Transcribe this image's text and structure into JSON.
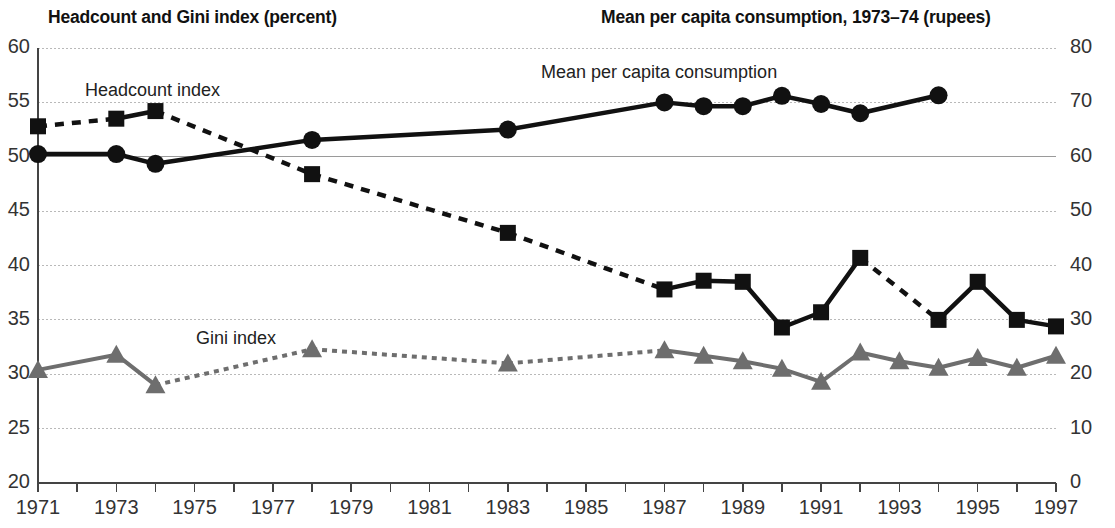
{
  "titles": {
    "left": "Headcount and Gini index (percent)",
    "right": "Mean per capita consumption, 1973–74 (rupees)"
  },
  "series_labels": {
    "headcount": "Headcount index",
    "gini": "Gini index",
    "consumption": "Mean per capita consumption"
  },
  "colors": {
    "headcount": "#111111",
    "consumption": "#111111",
    "gini": "#6e6e6e",
    "grid": "#b9b9b9",
    "axis": "#555555",
    "text": "#1a1a1a"
  },
  "chart_data": {
    "type": "line",
    "xlabel": "",
    "ylabel": "Headcount and Gini index (percent)",
    "y2label": "Mean per capita consumption, 1973–74 (rupees)",
    "xlim": [
      1971,
      1997
    ],
    "ylim": [
      20,
      60
    ],
    "y2lim": [
      0,
      80
    ],
    "yticks": [
      20,
      25,
      30,
      35,
      40,
      45,
      50,
      55,
      60
    ],
    "y2ticks": [
      0,
      10,
      20,
      30,
      40,
      50,
      60,
      70,
      80
    ],
    "xticks": [
      1971,
      1972,
      1973,
      1974,
      1975,
      1976,
      1977,
      1978,
      1979,
      1980,
      1981,
      1982,
      1983,
      1984,
      1985,
      1986,
      1987,
      1988,
      1989,
      1990,
      1991,
      1992,
      1993,
      1994,
      1995,
      1996,
      1997
    ],
    "xtick_labels": [
      "1971",
      "",
      "1973",
      "",
      "1975",
      "",
      "1977",
      "",
      "1979",
      "",
      "1981",
      "",
      "1983",
      "",
      "1985",
      "",
      "1987",
      "",
      "1989",
      "",
      "1991",
      "",
      "1993",
      "",
      "1995",
      "",
      "1997"
    ],
    "grid": true,
    "legend": "inline-annotations",
    "series": [
      {
        "name": "Headcount index",
        "axis": "left",
        "marker": "square",
        "linestyle": "mixed",
        "points": [
          {
            "x": 1971,
            "y": 52.8,
            "gap_after": true
          },
          {
            "x": 1973,
            "y": 53.5,
            "gap_after": false
          },
          {
            "x": 1974,
            "y": 54.2,
            "gap_after": true
          },
          {
            "x": 1978,
            "y": 48.4,
            "gap_after": true
          },
          {
            "x": 1983,
            "y": 43.0,
            "gap_after": true
          },
          {
            "x": 1987,
            "y": 37.8,
            "gap_after": false
          },
          {
            "x": 1988,
            "y": 38.6,
            "gap_after": false
          },
          {
            "x": 1989,
            "y": 38.5,
            "gap_after": false
          },
          {
            "x": 1990,
            "y": 34.3,
            "gap_after": false
          },
          {
            "x": 1991,
            "y": 35.7,
            "gap_after": false
          },
          {
            "x": 1992,
            "y": 40.7,
            "gap_after": true
          },
          {
            "x": 1994,
            "y": 35.0,
            "gap_after": false
          },
          {
            "x": 1995,
            "y": 38.5,
            "gap_after": false
          },
          {
            "x": 1996,
            "y": 35.0,
            "gap_after": false
          },
          {
            "x": 1997,
            "y": 34.4,
            "gap_after": false
          }
        ]
      },
      {
        "name": "Gini index",
        "axis": "left",
        "marker": "triangle",
        "linestyle": "mixed",
        "points": [
          {
            "x": 1971,
            "y": 30.4,
            "gap_after": false
          },
          {
            "x": 1973,
            "y": 31.8,
            "gap_after": false
          },
          {
            "x": 1974,
            "y": 29.0,
            "gap_after": true
          },
          {
            "x": 1978,
            "y": 32.3,
            "gap_after": true
          },
          {
            "x": 1983,
            "y": 31.0,
            "gap_after": true
          },
          {
            "x": 1987,
            "y": 32.2,
            "gap_after": false
          },
          {
            "x": 1988,
            "y": 31.7,
            "gap_after": false
          },
          {
            "x": 1989,
            "y": 31.2,
            "gap_after": false
          },
          {
            "x": 1990,
            "y": 30.5,
            "gap_after": false
          },
          {
            "x": 1991,
            "y": 29.3,
            "gap_after": false
          },
          {
            "x": 1992,
            "y": 32.0,
            "gap_after": false
          },
          {
            "x": 1993,
            "y": 31.2,
            "gap_after": false
          },
          {
            "x": 1994,
            "y": 30.6,
            "gap_after": false
          },
          {
            "x": 1995,
            "y": 31.5,
            "gap_after": false
          },
          {
            "x": 1996,
            "y": 30.6,
            "gap_after": false
          },
          {
            "x": 1997,
            "y": 31.7,
            "gap_after": false
          }
        ]
      },
      {
        "name": "Mean per capita consumption",
        "axis": "right",
        "marker": "circle",
        "linestyle": "solid",
        "points": [
          {
            "x": 1971,
            "y": 60.5,
            "gap_after": false
          },
          {
            "x": 1973,
            "y": 60.5,
            "gap_after": false
          },
          {
            "x": 1974,
            "y": 58.7,
            "gap_after": false
          },
          {
            "x": 1978,
            "y": 63.1,
            "gap_after": false
          },
          {
            "x": 1983,
            "y": 65.0,
            "gap_after": false
          },
          {
            "x": 1987,
            "y": 70.0,
            "gap_after": false
          },
          {
            "x": 1988,
            "y": 69.3,
            "gap_after": false
          },
          {
            "x": 1989,
            "y": 69.3,
            "gap_after": false
          },
          {
            "x": 1990,
            "y": 71.2,
            "gap_after": false
          },
          {
            "x": 1991,
            "y": 69.7,
            "gap_after": false
          },
          {
            "x": 1992,
            "y": 68.0,
            "gap_after": false
          },
          {
            "x": 1994,
            "y": 71.3,
            "gap_after": false
          }
        ]
      }
    ]
  }
}
